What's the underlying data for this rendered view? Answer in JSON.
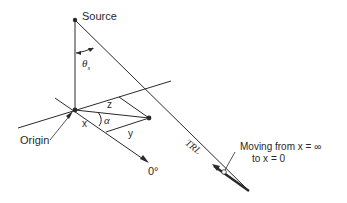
{
  "diagram": {
    "labels": {
      "source": "Source",
      "theta": "θ",
      "theta_sub": "s",
      "z": "z",
      "alpha": "α",
      "x": "x",
      "y": "y",
      "origin": "Origin",
      "zero_deg": "0°",
      "trl": "TRL",
      "moving_line1": "Moving from x = ∞",
      "moving_line2": "to x = 0"
    },
    "colors": {
      "stroke": "#2a2a2a",
      "background": "#ffffff"
    }
  }
}
